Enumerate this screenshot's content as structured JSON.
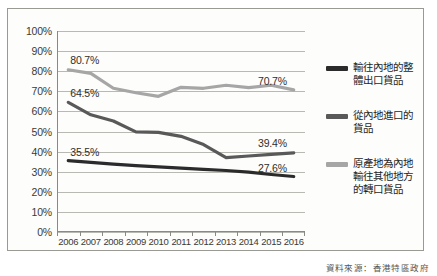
{
  "source_note": "資料來源：香港特區政府",
  "axes": {
    "y_ticks": [
      "100%",
      "90%",
      "80%",
      "70%",
      "60%",
      "50%",
      "40%",
      "30%",
      "20%",
      "10%",
      "0%"
    ],
    "x_ticks": [
      "2006",
      "2007",
      "2008",
      "2009",
      "2010",
      "2011",
      "2012",
      "2013",
      "2014",
      "2015",
      "2016"
    ]
  },
  "legend": {
    "items": [
      {
        "label": "輸往內地的整體出口貨品",
        "color": "#2b2b2b"
      },
      {
        "label": "從內地進口的貨品",
        "color": "#595959"
      },
      {
        "label": "原產地為內地輸往其他地方的轉口貨品",
        "color": "#a6a6a6"
      }
    ]
  },
  "labels": {
    "start_top": "80.7%",
    "start_mid": "64.5%",
    "start_low": "35.5%",
    "end_top": "70.7%",
    "end_mid": "39.4%",
    "end_low": "27.6%"
  },
  "chart_data": {
    "type": "line",
    "title": "",
    "xlabel": "",
    "ylabel": "",
    "ylim": [
      0,
      100
    ],
    "grid": true,
    "legend_position": "right",
    "x": [
      "2006",
      "2007",
      "2008",
      "2009",
      "2010",
      "2011",
      "2012",
      "2013",
      "2014",
      "2015",
      "2016"
    ],
    "series": [
      {
        "name": "原產地為內地輸往其他地方的轉口貨品",
        "color": "#a6a6a6",
        "values": [
          80.7,
          78.9,
          71.5,
          69.3,
          67.5,
          72.0,
          71.5,
          73.0,
          71.8,
          73.0,
          70.7
        ],
        "start_label": "80.7%",
        "end_label": "70.7%"
      },
      {
        "name": "輸往內地的整體出口貨品",
        "color": "#595959",
        "values": [
          64.5,
          58.3,
          55.2,
          49.8,
          49.6,
          47.6,
          43.5,
          37.0,
          37.8,
          38.6,
          39.4
        ],
        "start_label": "64.5%",
        "end_label": "39.4%"
      },
      {
        "name": "從內地進口的貨品",
        "color": "#2b2b2b",
        "values": [
          35.5,
          34.6,
          33.8,
          33.0,
          32.4,
          31.8,
          31.2,
          30.6,
          29.8,
          28.6,
          27.6
        ],
        "start_label": "35.5%",
        "end_label": "27.6%"
      }
    ]
  }
}
